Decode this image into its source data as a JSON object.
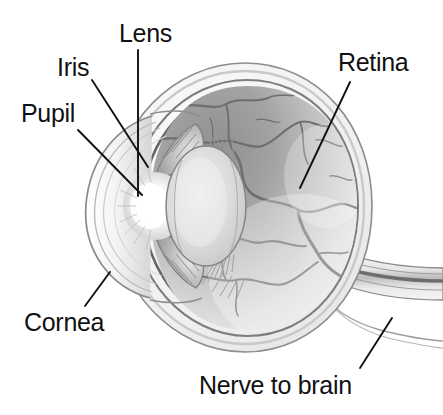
{
  "diagram": {
    "title_visible_fragment": "",
    "background_color": "#ffffff",
    "ink_color": "#111111",
    "labels": [
      {
        "id": "lens",
        "text": "Lens",
        "x": 119,
        "y": 21,
        "leader": "vertical line down to the lens body"
      },
      {
        "id": "iris",
        "text": "Iris",
        "x": 57,
        "y": 55,
        "leader": "diagonal line down-right to the iris"
      },
      {
        "id": "pupil",
        "text": "Pupil",
        "x": 21,
        "y": 101,
        "leader": "diagonal line down-right to the pupil opening"
      },
      {
        "id": "retina",
        "text": "Retina",
        "x": 338,
        "y": 50,
        "leader": "diagonal line down-left to the retinal wall"
      },
      {
        "id": "cornea",
        "text": "Cornea",
        "x": 24,
        "y": 310,
        "leader": "diagonal line up-right to the corneal dome"
      },
      {
        "id": "nerve",
        "text": "Nerve to brain",
        "x": 199,
        "y": 373,
        "leader": "diagonal line up-right to the optic nerve stalk"
      }
    ],
    "anatomy_parts": [
      "sclera",
      "cornea",
      "anterior chamber",
      "iris",
      "pupil",
      "lens",
      "ciliary zonules",
      "vitreous body",
      "retina",
      "choroid vessels",
      "optic nerve"
    ],
    "palette": {
      "sclera_outer": "#f2f2f2",
      "sclera_line": "#6f6f6f",
      "vitreous_dark": "#9a9a9a",
      "vitreous_light": "#e6e6e6",
      "lens_fill": "#d8d8d8",
      "pupil_highlight": "#fdfdfd",
      "vessel": "#707070",
      "label_text": "#111111"
    }
  }
}
